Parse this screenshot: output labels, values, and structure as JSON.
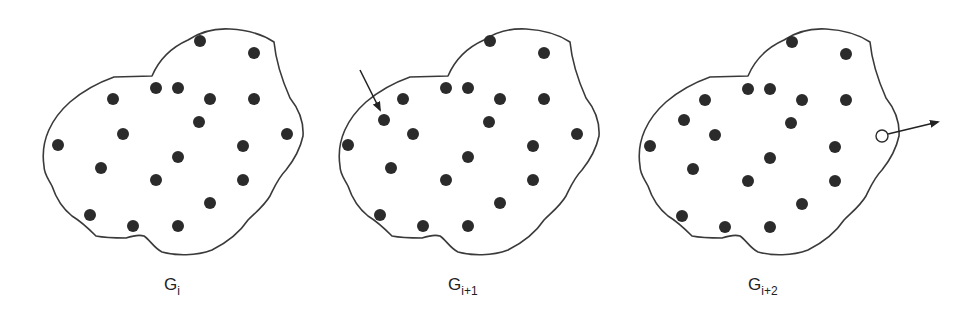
{
  "figure": {
    "panels": [
      {
        "id": "g-i",
        "label_main": "G",
        "label_sub": "i",
        "filled_nodes": 20,
        "event": "none"
      },
      {
        "id": "g-i-plus-1",
        "label_main": "G",
        "label_sub": "i+1",
        "filled_nodes": 21,
        "event": "node-added",
        "event_marker": "arrow pointing in to new node"
      },
      {
        "id": "g-i-plus-2",
        "label_main": "G",
        "label_sub": "i+2",
        "filled_nodes": 21,
        "open_nodes": 1,
        "event": "node-removed",
        "event_marker": "arrow pointing out from hollow node"
      }
    ],
    "colors": {
      "outline": "#3a3a3a",
      "node_fill": "#2b2b2b",
      "background": "#ffffff"
    }
  }
}
